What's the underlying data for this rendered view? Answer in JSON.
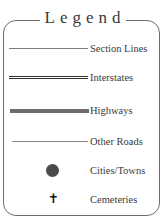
{
  "legend": {
    "title": "Legend",
    "items": [
      {
        "label": "Section Lines",
        "symbol": "thin-line",
        "color": "#7a7a7a"
      },
      {
        "label": "Interstates",
        "symbol": "double-line",
        "color": "#333333"
      },
      {
        "label": "Highways",
        "symbol": "thick-line",
        "color": "#6b6b6b"
      },
      {
        "label": "Other Roads",
        "symbol": "thin-line",
        "color": "#8a8a8a"
      },
      {
        "label": "Cities/Towns",
        "symbol": "filled-circle",
        "color": "#4a4a4a"
      },
      {
        "label": "Cemeteries",
        "symbol": "cross-icon",
        "glyph": "✝",
        "color": "#111111"
      }
    ]
  }
}
